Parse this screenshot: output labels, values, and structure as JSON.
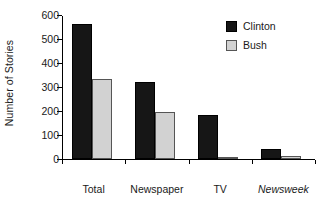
{
  "chart_data": {
    "type": "bar",
    "title": "",
    "xlabel": "",
    "ylabel": "Number of Stories",
    "categories": [
      "Total",
      "Newspaper",
      "TV",
      "Newsweek"
    ],
    "category_styles": [
      "normal",
      "normal",
      "normal",
      "italic"
    ],
    "series": [
      {
        "name": "Clinton",
        "color": "#161616",
        "values": [
          563,
          320,
          183,
          42
        ]
      },
      {
        "name": "Bush",
        "color": "#d2d2d2",
        "values": [
          333,
          197,
          9,
          13
        ]
      }
    ],
    "ylim": [
      0,
      600
    ],
    "yticks": [
      0,
      100,
      200,
      300,
      400,
      500,
      600
    ],
    "ytick_labels": [
      "0",
      "100",
      "200",
      "300",
      "400",
      "500",
      "600"
    ],
    "grid": false,
    "legend_position": "top-right",
    "legend_entries": [
      "Clinton",
      "Bush"
    ]
  },
  "axis": {
    "y_title": "Number of Stories"
  },
  "legend": {
    "items": [
      {
        "label": "Clinton"
      },
      {
        "label": "Bush"
      }
    ]
  }
}
